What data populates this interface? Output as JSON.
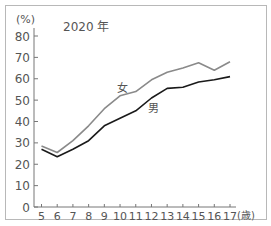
{
  "chart_data": {
    "type": "line",
    "title": "2020 年",
    "xlabel": "(歳)",
    "ylabel": "(%)",
    "x": [
      5,
      6,
      7,
      8,
      9,
      10,
      11,
      12,
      13,
      14,
      15,
      16,
      17
    ],
    "x_tick_labels": [
      "5",
      "6",
      "7",
      "8",
      "9",
      "10",
      "11",
      "12",
      "13",
      "14",
      "15",
      "16",
      "17"
    ],
    "y_ticks": [
      0,
      10,
      20,
      30,
      40,
      50,
      60,
      70,
      80
    ],
    "y_tick_labels": [
      "0",
      "10",
      "20",
      "30",
      "40",
      "50",
      "60",
      "70",
      "80"
    ],
    "ylim": [
      0,
      80
    ],
    "xlim": [
      5,
      17
    ],
    "grid": false,
    "series": [
      {
        "name": "女",
        "color": "#8a8a8a",
        "values": [
          28.5,
          25.5,
          31,
          38,
          46,
          52,
          54,
          59.5,
          63,
          65,
          67.5,
          64,
          68
        ]
      },
      {
        "name": "男",
        "color": "#1a1a1a",
        "values": [
          27,
          23.5,
          27,
          31,
          38,
          41.5,
          45,
          51,
          55.5,
          56,
          58.5,
          59.5,
          61
        ]
      }
    ]
  }
}
